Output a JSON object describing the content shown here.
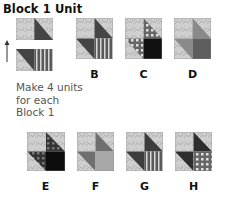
{
  "title": "Block 1 Unit",
  "instructions": {
    "line1": "Make 4 units",
    "line2": "for each",
    "line3": "Block 1"
  },
  "unit": {
    "pieces": [
      "top-pair",
      "bottom-pair"
    ],
    "arrow": "up-arrow-icon"
  },
  "blocks": [
    {
      "label": "B"
    },
    {
      "label": "C"
    },
    {
      "label": "D"
    },
    {
      "label": "E"
    },
    {
      "label": "F"
    },
    {
      "label": "G"
    },
    {
      "label": "H"
    }
  ],
  "colors": {
    "light_print": "#c9c9c9",
    "dark": "#3f3f3f",
    "medium": "#8a8a8a",
    "black": "#111111",
    "text": "#111111"
  }
}
